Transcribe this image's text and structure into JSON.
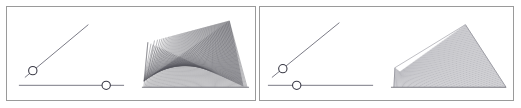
{
  "app": {
    "title": "Line Envelope Demo",
    "background_color": "#ffffff",
    "width": 521,
    "height": 108
  },
  "style": {
    "panel_border_color": "#9a9a9a",
    "control_line_color": "#6a6a76",
    "handle_stroke_color": "#3a3a46",
    "handle_fill_color": "#ffffff",
    "envelope_line_color": "#55555e",
    "fan_line_color": "#6e6e78",
    "baseline_color": "#5a5a62"
  },
  "panels": [
    {
      "id": "panel-left",
      "name": "left-panel",
      "label": "",
      "controls": {
        "angle_slider": {
          "name": "angle-slider",
          "label": "",
          "x1": 18,
          "y1": 72,
          "x2": 82,
          "y2": 18,
          "handle": {
            "cx": 26,
            "cy": 65,
            "r": 4.2,
            "value": 0.13
          }
        },
        "length_slider": {
          "name": "length-slider",
          "label": "",
          "x1": 12,
          "y1": 80,
          "x2": 118,
          "y2": 80,
          "handle": {
            "cx": 100,
            "cy": 80,
            "r": 4.2,
            "value": 0.83
          }
        }
      },
      "figure": {
        "name": "envelope-figure",
        "type": "line-envelope-cusp",
        "line_count": 96,
        "baseline": {
          "x1": 136,
          "y1": 82,
          "x2": 244,
          "y2": 82
        },
        "cusp_tip": {
          "x": 222,
          "y": 14
        },
        "family": {
          "a_start": {
            "x": 138,
            "y": 76
          },
          "a_end": {
            "x": 244,
            "y": 82
          },
          "b_start": {
            "x": 224,
            "y": 14
          },
          "b_end": {
            "x": 142,
            "y": 36
          },
          "fold": 0.58
        }
      }
    },
    {
      "id": "panel-right",
      "name": "right-panel",
      "label": "",
      "controls": {
        "angle_slider": {
          "name": "angle-slider",
          "label": "",
          "x1": 12,
          "y1": 72,
          "x2": 80,
          "y2": 16,
          "handle": {
            "cx": 23,
            "cy": 63,
            "r": 4.2,
            "value": 0.16
          }
        },
        "length_slider": {
          "name": "length-slider",
          "label": "",
          "x1": 8,
          "y1": 80,
          "x2": 114,
          "y2": 80,
          "handle": {
            "cx": 37,
            "cy": 80,
            "r": 4.2,
            "value": 0.27
          }
        }
      },
      "figure": {
        "name": "fan-figure",
        "type": "line-fan-quadrilateral",
        "line_count": 92,
        "baseline": {
          "x1": 132,
          "y1": 82,
          "x2": 248,
          "y2": 82
        },
        "quad": {
          "bottom_left": {
            "x": 135,
            "y": 82
          },
          "bottom_right": {
            "x": 248,
            "y": 82
          },
          "top_right": {
            "x": 207,
            "y": 18
          },
          "top_left": {
            "x": 136,
            "y": 62
          },
          "notch": {
            "x": 141,
            "y": 66
          }
        }
      }
    }
  ]
}
